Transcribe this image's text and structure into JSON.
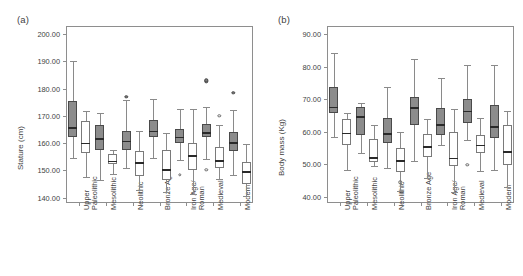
{
  "figure": {
    "panels": [
      {
        "id": "a",
        "label": "(a)",
        "ylabel": "Stature (cm)"
      },
      {
        "id": "b",
        "label": "(b)",
        "ylabel": "Body mass (Kg)"
      }
    ]
  },
  "chart_data": [
    {
      "type": "box",
      "panel": "a",
      "title": "(a)",
      "xlabel": "",
      "ylabel": "Stature (cm)",
      "ylim": [
        138.0,
        203.0
      ],
      "yticks": [
        140.0,
        150.0,
        160.0,
        170.0,
        180.0,
        190.0,
        200.0
      ],
      "ytick_labels": [
        "140.00",
        "150.00",
        "160.00",
        "170.00",
        "180.00",
        "190.00",
        "200.00"
      ],
      "grid": false,
      "legend": "none",
      "categories": [
        "Upper\nPaleolithic",
        "Mesolithic",
        "Neolithic",
        "Bronze Age",
        "Iron Age/\nRoman",
        "Medieval",
        "Modern"
      ],
      "series": [
        {
          "name": "male",
          "style": "filled",
          "boxes": [
            {
              "category": "Upper Paleolithic",
              "min": 154.6,
              "q1": 162.2,
              "median": 165.8,
              "q3": 175.5,
              "max": 190.2,
              "outliers": []
            },
            {
              "category": "Mesolithic",
              "min": 146.5,
              "q1": 157.4,
              "median": 161.8,
              "q3": 166.6,
              "max": 171.2,
              "outliers": []
            },
            {
              "category": "Neolithic",
              "min": 151.0,
              "q1": 157.5,
              "median": 160.9,
              "q3": 164.6,
              "max": 176.0,
              "outliers": [
                176.9
              ]
            },
            {
              "category": "Bronze Age",
              "min": 154.5,
              "q1": 162.2,
              "median": 164.6,
              "q3": 168.3,
              "max": 176.3,
              "outliers": []
            },
            {
              "category": "Iron Age/Roman",
              "min": 153.7,
              "q1": 159.9,
              "median": 162.4,
              "q3": 165.1,
              "max": 172.4,
              "outliers": [
                148.4
              ]
            },
            {
              "category": "Medieval",
              "min": 154.2,
              "q1": 162.4,
              "median": 164.0,
              "q3": 167.0,
              "max": 173.1,
              "outliers": [
                150.1,
                182.7,
                183.1
              ]
            },
            {
              "category": "Modern",
              "min": 148.1,
              "q1": 157.2,
              "median": 160.4,
              "q3": 164.2,
              "max": 172.3,
              "outliers": [
                178.4
              ]
            }
          ]
        },
        {
          "name": "female",
          "style": "open",
          "boxes": [
            {
              "category": "Upper Paleolithic",
              "min": 147.4,
              "q1": 156.5,
              "median": 160.1,
              "q3": 168.0,
              "max": 171.9,
              "outliers": []
            },
            {
              "category": "Mesolithic",
              "min": 148.5,
              "q1": 152.2,
              "median": 153.5,
              "q3": 156.1,
              "max": 157.6,
              "outliers": []
            },
            {
              "category": "Neolithic",
              "min": 142.6,
              "q1": 147.9,
              "median": 153.0,
              "q3": 157.2,
              "max": 164.6,
              "outliers": []
            },
            {
              "category": "Bronze Age",
              "min": 142.2,
              "q1": 146.6,
              "median": 150.5,
              "q3": 157.6,
              "max": 163.6,
              "outliers": []
            },
            {
              "category": "Iron Age/Roman",
              "min": 141.4,
              "q1": 150.2,
              "median": 155.5,
              "q3": 160.1,
              "max": 172.4,
              "outliers": []
            },
            {
              "category": "Medieval",
              "min": 146.8,
              "q1": 151.0,
              "median": 153.8,
              "q3": 158.7,
              "max": 166.8,
              "outliers": [
                170.0
              ]
            },
            {
              "category": "Modern",
              "min": 140.6,
              "q1": 145.1,
              "median": 149.6,
              "q3": 153.1,
              "max": 159.5,
              "outliers": []
            }
          ]
        }
      ]
    },
    {
      "type": "box",
      "panel": "b",
      "title": "(b)",
      "xlabel": "",
      "ylabel": "Body mass (Kg)",
      "ylim": [
        38.0,
        92.5
      ],
      "yticks": [
        40.0,
        50.0,
        60.0,
        70.0,
        80.0,
        90.0
      ],
      "ytick_labels": [
        "40.00",
        "50.00",
        "60.00",
        "70.00",
        "80.00",
        "90.00"
      ],
      "grid": false,
      "legend": "none",
      "categories": [
        "Upper\nPaleolithic",
        "Mesolithic",
        "Neolithic",
        "Bronze Age",
        "Iron Age/\nRoman",
        "Medieval",
        "Modern"
      ],
      "series": [
        {
          "name": "male",
          "style": "filled",
          "boxes": [
            {
              "category": "Upper Paleolithic",
              "min": 58.4,
              "q1": 65.8,
              "median": 67.6,
              "q3": 73.6,
              "max": 84.3,
              "outliers": []
            },
            {
              "category": "Mesolithic",
              "min": 53.3,
              "q1": 58.8,
              "median": 64.8,
              "q3": 67.6,
              "max": 68.9,
              "outliers": []
            },
            {
              "category": "Neolithic",
              "min": 48.7,
              "q1": 56.4,
              "median": 59.4,
              "q3": 64.2,
              "max": 73.7,
              "outliers": []
            },
            {
              "category": "Bronze Age",
              "min": 50.8,
              "q1": 61.9,
              "median": 67.5,
              "q3": 70.7,
              "max": 82.4,
              "outliers": []
            },
            {
              "category": "Iron Age/Roman",
              "min": 55.8,
              "q1": 58.9,
              "median": 62.2,
              "q3": 67.3,
              "max": 76.4,
              "outliers": []
            },
            {
              "category": "Medieval",
              "min": 57.5,
              "q1": 62.6,
              "median": 66.4,
              "q3": 69.9,
              "max": 80.6,
              "outliers": [
                49.7
              ]
            },
            {
              "category": "Modern",
              "min": 48.2,
              "q1": 57.9,
              "median": 61.7,
              "q3": 68.3,
              "max": 80.5,
              "outliers": []
            }
          ]
        },
        {
          "name": "female",
          "style": "open",
          "boxes": [
            {
              "category": "Upper Paleolithic",
              "min": 48.1,
              "q1": 55.8,
              "median": 59.7,
              "q3": 63.9,
              "max": 65.7,
              "outliers": []
            },
            {
              "category": "Mesolithic",
              "min": 49.4,
              "q1": 50.6,
              "median": 52.1,
              "q3": 57.8,
              "max": 62.0,
              "outliers": []
            },
            {
              "category": "Neolithic",
              "min": 41.8,
              "q1": 47.6,
              "median": 51.2,
              "q3": 54.8,
              "max": 60.0,
              "outliers": [
                44.4
              ]
            },
            {
              "category": "Bronze Age",
              "min": 45.7,
              "q1": 52.3,
              "median": 55.5,
              "q3": 59.2,
              "max": 63.8,
              "outliers": []
            },
            {
              "category": "Iron Age/Roman",
              "min": 41.3,
              "q1": 49.5,
              "median": 51.9,
              "q3": 60.0,
              "max": 66.8,
              "outliers": []
            },
            {
              "category": "Medieval",
              "min": 47.7,
              "q1": 53.4,
              "median": 55.9,
              "q3": 58.9,
              "max": 64.1,
              "outliers": []
            },
            {
              "category": "Modern",
              "min": 42.8,
              "q1": 49.6,
              "median": 53.9,
              "q3": 62.0,
              "max": 66.3,
              "outliers": []
            }
          ]
        }
      ]
    }
  ]
}
